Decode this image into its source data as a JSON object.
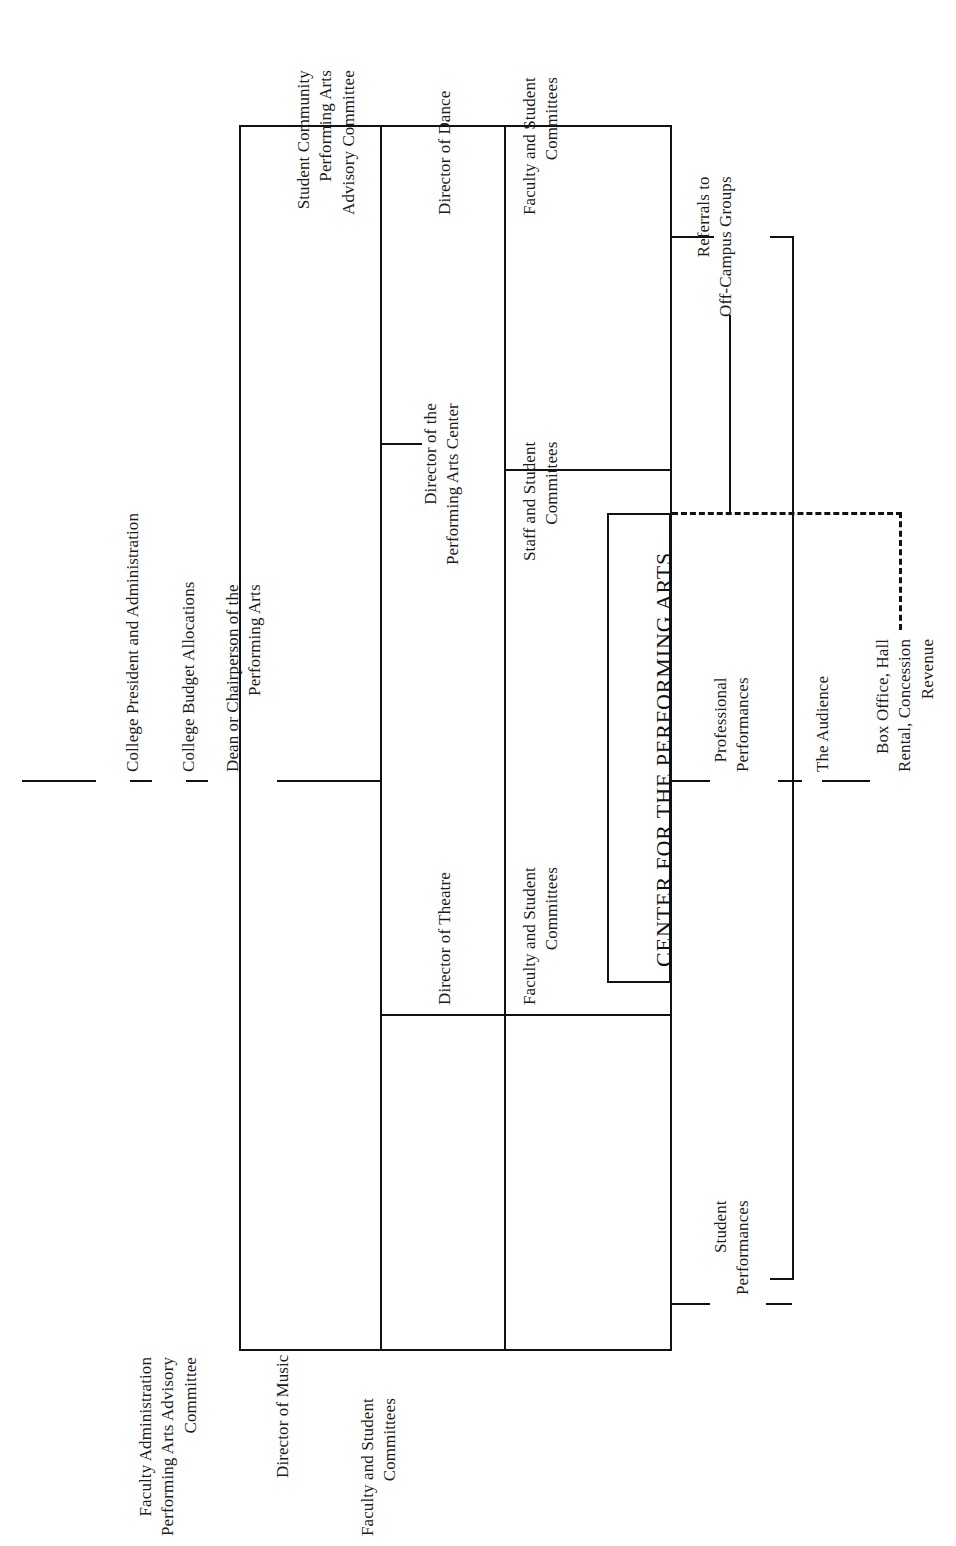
{
  "diagram": {
    "type": "organization-chart",
    "orientation": "rotated-90-counterclockwise",
    "center": {
      "title": "CENTER FOR THE PERFORMING ARTS"
    },
    "nodes": {
      "college_president": "College President and Administration",
      "college_budget": "College Budget Allocations",
      "dean": "Dean or Chairperson of the\nPerforming Arts",
      "student_community_committee": "Student Community\nPerforming Arts\nAdvisory Committee",
      "faculty_admin_committee": "Faculty Administration\nPerforming Arts Advisory\nCommittee",
      "director_dance": "Director of Dance",
      "director_pac": "Director of the\nPerforming Arts Center",
      "director_theatre": "Director of Theatre",
      "director_music": "Director of Music",
      "faculty_student_committees_dance": "Faculty and Student\nCommittees",
      "staff_student_committees": "Staff and Student\nCommittees",
      "faculty_student_committees_theatre": "Faculty and Student\nCommittees",
      "faculty_student_committees_music": "Faculty and Student\nCommittees",
      "referrals": "Referrals to\nOff-Campus Groups",
      "professional_performances": "Professional\nPerformances",
      "student_performances": "Student\nPerformances",
      "the_audience": "The Audience",
      "box_office": "Box Office, Hall\nRental, Concession\nRevenue"
    },
    "colors": {
      "line": "#111111",
      "text": "#1b1b1b",
      "background": "#ffffff"
    }
  }
}
